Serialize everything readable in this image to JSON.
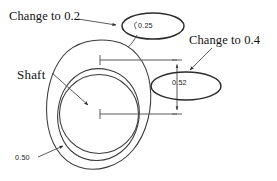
{
  "diagram": {
    "type": "engineering-drawing",
    "stroke_color": "#3a3a3a",
    "highlight_color": "#2b2b2b",
    "background_color": "#ffffff"
  },
  "annotations": {
    "change_to_02": "Change to 0.2",
    "change_to_04": "Change to 0.4",
    "shaft_label": "Shaft"
  },
  "dimensions": {
    "top_callout_value": "0.25",
    "right_callout_value": "0.52",
    "outline_value": "0.50"
  },
  "icons": {
    "leader_arrow": "leader-arrow-icon",
    "dimension_arrow": "dimension-arrow-icon",
    "center_mark": "center-mark-icon",
    "highlight_ellipse": "highlight-ellipse-icon"
  }
}
